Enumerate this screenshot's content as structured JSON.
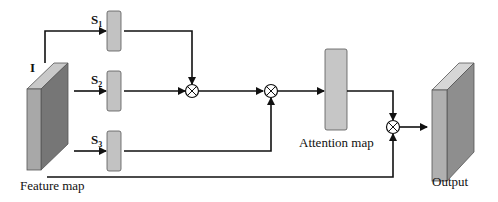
{
  "diagram": {
    "title": "",
    "nodes": {
      "feature_map": {
        "label": "Feature map",
        "input_label": "I",
        "front": "#a8a8a8",
        "side": "#767676",
        "top": "#c9c9c9"
      },
      "s1": {
        "label": "S",
        "sub": "1",
        "fill": "#c2c2c2"
      },
      "s2": {
        "label": "S",
        "sub": "2",
        "fill": "#c2c2c2"
      },
      "s3": {
        "label": "S",
        "sub": "3",
        "fill": "#c2c2c2"
      },
      "mul1": {
        "symbol": "⊗"
      },
      "mul2": {
        "symbol": "⊗"
      },
      "mul3": {
        "symbol": "⊗"
      },
      "attention_map": {
        "label": "Attention map",
        "fill": "#c6c6c6"
      },
      "output": {
        "label": "Output",
        "front": "#b0b0b0",
        "side": "#8e8e8e",
        "top": "#d6d6d6"
      }
    },
    "edges": [
      {
        "from": "feature_map",
        "to": "s1"
      },
      {
        "from": "feature_map",
        "to": "s2"
      },
      {
        "from": "feature_map",
        "to": "s3"
      },
      {
        "from": "s1",
        "to": "mul1"
      },
      {
        "from": "s2",
        "to": "mul1"
      },
      {
        "from": "mul1",
        "to": "mul2"
      },
      {
        "from": "s3",
        "to": "mul2"
      },
      {
        "from": "mul2",
        "to": "attention_map"
      },
      {
        "from": "attention_map",
        "to": "mul3"
      },
      {
        "from": "feature_map",
        "to": "mul3"
      },
      {
        "from": "mul3",
        "to": "output"
      }
    ],
    "line_color": "#111111"
  }
}
